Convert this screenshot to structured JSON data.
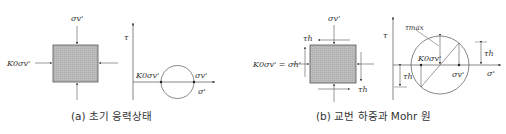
{
  "panel_a": {
    "caption": "(a) 초기 응력상태",
    "element": {
      "top_load_label": "σv'",
      "side_load_label": "K0σv'"
    },
    "mohr": {
      "tau_axis_label": "τ",
      "sigma_axis_label": "σ'",
      "left_point_label": "K0σv'",
      "right_point_label": "σv'"
    }
  },
  "panel_b": {
    "caption": "(b) 교번 하중과 Mohr 원",
    "element": {
      "top_load_label": "σv'",
      "side_load_label": "K0σv' = σh'",
      "shear_label_top": "τh",
      "shear_label_bottom": "τh"
    },
    "mohr": {
      "tau_axis_label": "τ",
      "sigma_axis_label": "σ'",
      "tau_max_label": "τmax",
      "left_point_label": "K0σv'",
      "right_point_label": "σv'",
      "tau_h_right_label": "τh",
      "tau_h_left_label": "τh"
    }
  },
  "colors": {
    "line": "#555555",
    "fill": "#b8b8b8",
    "text": "#333333"
  }
}
